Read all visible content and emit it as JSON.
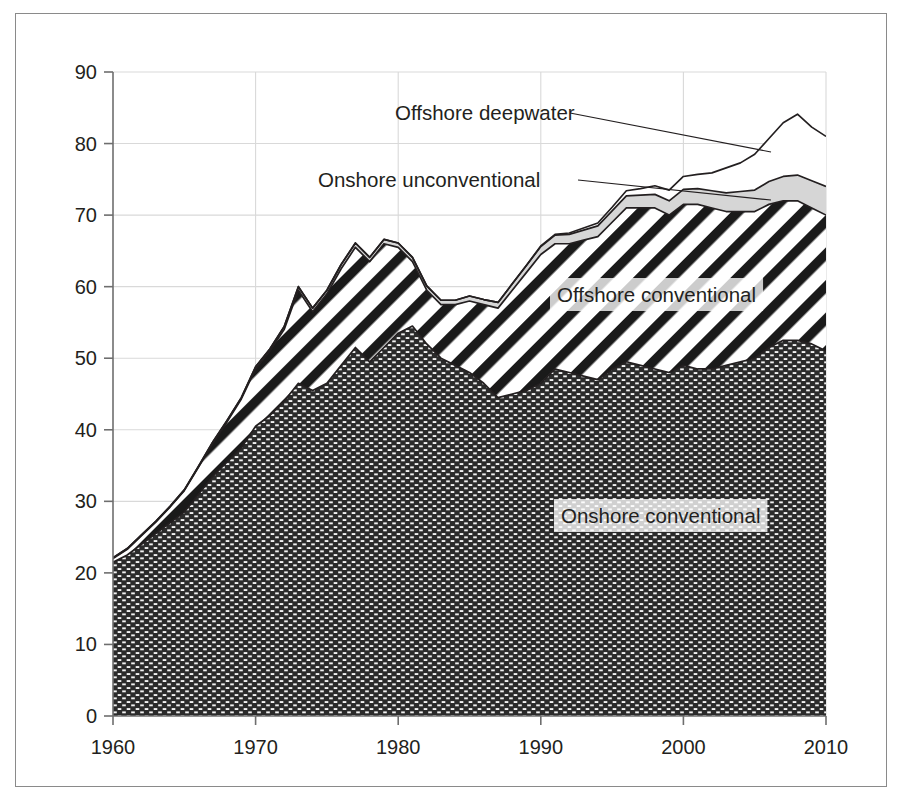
{
  "chart_data": {
    "type": "area",
    "stacked": true,
    "title": "",
    "subtitle": "",
    "xlabel": "",
    "ylabel": "",
    "xlim": [
      1960,
      2010
    ],
    "ylim": [
      0,
      90
    ],
    "grid": true,
    "legend_position": "inline-annotations",
    "x_tick_labels": [
      "1960",
      "1970",
      "1980",
      "1990",
      "2000",
      "2010"
    ],
    "x_ticks": [
      1960,
      1970,
      1980,
      1990,
      2000,
      2010
    ],
    "y_tick_labels": [
      "0",
      "10",
      "20",
      "30",
      "40",
      "50",
      "60",
      "70",
      "80",
      "90"
    ],
    "y_ticks": [
      0,
      10,
      20,
      30,
      40,
      50,
      60,
      70,
      80,
      90
    ],
    "x": [
      1960,
      1961,
      1962,
      1963,
      1964,
      1965,
      1966,
      1967,
      1968,
      1969,
      1970,
      1971,
      1972,
      1973,
      1974,
      1975,
      1976,
      1977,
      1978,
      1979,
      1980,
      1981,
      1982,
      1983,
      1984,
      1985,
      1986,
      1987,
      1988,
      1989,
      1990,
      1991,
      1992,
      1993,
      1994,
      1995,
      1996,
      1997,
      1998,
      1999,
      2000,
      2001,
      2002,
      2003,
      2004,
      2005,
      2006,
      2007,
      2008,
      2009,
      2010
    ],
    "series": [
      {
        "name": "Onshore conventional",
        "fill_pattern": "dark-brick-dots",
        "fill_color": "#2b2b2b",
        "values": [
          21.5,
          22.5,
          24.0,
          25.5,
          27.0,
          28.5,
          31.0,
          33.5,
          35.5,
          37.5,
          40.5,
          42.0,
          44.0,
          46.5,
          45.5,
          46.5,
          49.0,
          51.5,
          49.5,
          51.5,
          53.5,
          54.5,
          52.0,
          50.0,
          49.0,
          48.0,
          46.5,
          44.5,
          45.0,
          45.5,
          46.5,
          48.5,
          48.0,
          47.5,
          47.0,
          48.5,
          49.5,
          49.0,
          48.5,
          48.0,
          49.0,
          48.5,
          48.5,
          49.0,
          49.5,
          50.0,
          51.5,
          52.5,
          52.5,
          52.0,
          51.0
        ]
      },
      {
        "name": "Offshore conventional",
        "fill_pattern": "diagonal-hatch",
        "fill_color": "#1a1a1a",
        "values": [
          0.5,
          0.8,
          1.2,
          1.6,
          2.2,
          3.0,
          3.8,
          4.6,
          5.6,
          6.8,
          8.0,
          9.0,
          10.0,
          13.0,
          11.0,
          12.5,
          13.5,
          14.0,
          14.0,
          14.5,
          12.0,
          9.0,
          7.5,
          7.5,
          8.5,
          10.0,
          11.0,
          12.5,
          14.5,
          16.5,
          18.0,
          17.5,
          18.0,
          19.0,
          20.0,
          20.5,
          21.5,
          22.0,
          22.5,
          22.0,
          22.5,
          23.0,
          22.5,
          21.5,
          21.0,
          20.5,
          20.0,
          19.5,
          19.5,
          19.0,
          19.0
        ]
      },
      {
        "name": "Onshore unconventional",
        "fill_pattern": "light-gray",
        "fill_color": "#d6d6d6",
        "values": [
          0.1,
          0.1,
          0.1,
          0.1,
          0.1,
          0.1,
          0.1,
          0.2,
          0.2,
          0.2,
          0.3,
          0.3,
          0.4,
          0.5,
          0.5,
          0.5,
          0.6,
          0.6,
          0.6,
          0.6,
          0.6,
          0.6,
          0.6,
          0.6,
          0.6,
          0.7,
          0.7,
          0.8,
          0.9,
          1.0,
          1.1,
          1.2,
          1.3,
          1.4,
          1.5,
          1.6,
          1.7,
          1.8,
          1.9,
          2.0,
          2.1,
          2.2,
          2.4,
          2.6,
          2.8,
          3.0,
          3.2,
          3.4,
          3.6,
          3.8,
          4.0
        ]
      },
      {
        "name": "Offshore deepwater",
        "fill_pattern": "white",
        "fill_color": "#ffffff",
        "values": [
          0.0,
          0.0,
          0.0,
          0.0,
          0.0,
          0.0,
          0.0,
          0.0,
          0.0,
          0.0,
          0.0,
          0.0,
          0.0,
          0.0,
          0.0,
          0.0,
          0.0,
          0.0,
          0.0,
          0.0,
          0.0,
          0.0,
          0.0,
          0.0,
          0.0,
          0.0,
          0.0,
          0.0,
          0.0,
          0.0,
          0.1,
          0.1,
          0.2,
          0.3,
          0.4,
          0.5,
          0.7,
          0.9,
          1.2,
          1.5,
          1.8,
          2.0,
          2.5,
          3.5,
          4.0,
          5.0,
          6.0,
          7.5,
          8.5,
          7.5,
          7.0
        ]
      }
    ],
    "annotations": [
      {
        "text": "Offshore deepwater",
        "label_x": 395,
        "label_y": 120,
        "leader_from_x": 570,
        "leader_from_y": 113,
        "leader_to_x": 771,
        "leader_to_y": 152
      },
      {
        "text": "Onshore unconventional",
        "label_x": 318,
        "label_y": 187,
        "leader_from_x": 578,
        "leader_from_y": 180,
        "leader_to_x": 771,
        "leader_to_y": 200
      },
      {
        "text": "Offshore conventional",
        "label_x": 557,
        "label_y": 302,
        "boxed": true
      },
      {
        "text": "Onshore conventional",
        "label_x": 561,
        "label_y": 523,
        "boxed": true
      }
    ]
  }
}
